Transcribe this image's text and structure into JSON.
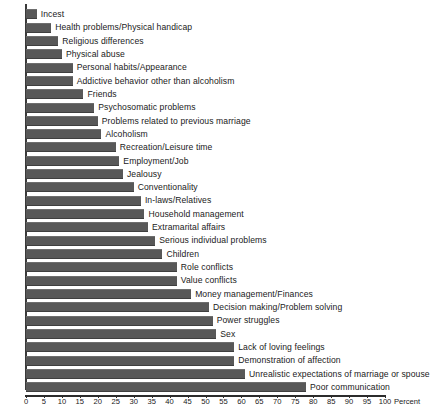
{
  "chart_data": {
    "type": "bar",
    "orientation": "horizontal",
    "title": "",
    "subtitle": "",
    "xlabel": "Percent",
    "ylabel": "",
    "xlim": [
      0,
      100
    ],
    "grid": false,
    "legend": null,
    "sort_order": "ascending-from-top",
    "axis_ticks": [
      0,
      5,
      10,
      15,
      20,
      25,
      30,
      35,
      40,
      45,
      50,
      55,
      60,
      65,
      70,
      75,
      80,
      85,
      90,
      95,
      100
    ],
    "bar_color": "#585858",
    "axis_color": "#2c2c2c",
    "categories": [
      "Incest",
      "Health problems/Physical handicap",
      "Religious differences",
      "Physical abuse",
      "Personal habits/Appearance",
      "Addictive behavior other than alcoholism",
      "Friends",
      "Psychosomatic problems",
      "Problems related to previous marriage",
      "Alcoholism",
      "Recreation/Leisure time",
      "Employment/Job",
      "Jealousy",
      "Conventionality",
      "In-laws/Relatives",
      "Household management",
      "Extramarital affairs",
      "Serious individual problems",
      "Children",
      "Role conflicts",
      "Value conflicts",
      "Money management/Finances",
      "Decision making/Problem solving",
      "Power struggles",
      "Sex",
      "Lack of loving feelings",
      "Demonstration of affection",
      "Unrealistic expectations of marriage or spouse",
      "Poor communication"
    ],
    "values": [
      3,
      7,
      9,
      10,
      13,
      13,
      16,
      19,
      20,
      21,
      25,
      26,
      27,
      30,
      32,
      33,
      34,
      36,
      38,
      42,
      42,
      46,
      51,
      52,
      53,
      58,
      58,
      61,
      78
    ]
  }
}
